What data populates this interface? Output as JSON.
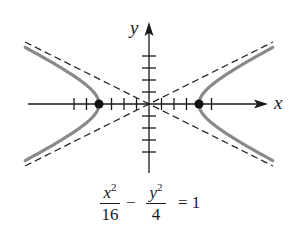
{
  "figure": {
    "type": "hyperbola",
    "equation": {
      "term1": {
        "numerator_var": "x",
        "numerator_exp": "2",
        "denominator": "16"
      },
      "operator": "−",
      "term2": {
        "numerator_var": "y",
        "numerator_exp": "2",
        "denominator": "4"
      },
      "equals": "= 1"
    },
    "axes": {
      "x_label": "x",
      "y_label": "y",
      "x_ticks_units": [
        -6,
        -5,
        -3,
        -2,
        -1,
        1,
        2,
        3,
        5
      ],
      "y_ticks_units": [
        -4,
        -3,
        -2,
        -1,
        1,
        2,
        3,
        4
      ]
    },
    "a": 4,
    "b": 2,
    "vertices": [
      [
        -4,
        0
      ],
      [
        4,
        0
      ]
    ],
    "asymptotes": [
      "y = x/2",
      "y = -x/2"
    ],
    "colors": {
      "curve": "#8a8a8a",
      "axes": "#1a1a1a",
      "asymptote": "#2a2a2a",
      "vertex": "#111111"
    }
  }
}
